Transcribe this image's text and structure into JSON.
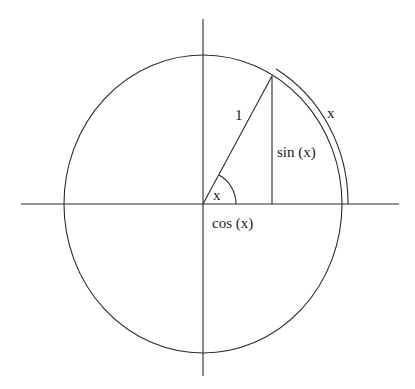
{
  "diagram": {
    "type": "unit-circle",
    "colors": {
      "stroke": "#2a2a2a",
      "text": "#1a1a1a",
      "background": "#ffffff"
    },
    "labels": {
      "radius": "1",
      "arc_length": "x",
      "angle": "x",
      "sine": "sin (x)",
      "cosine": "cos (x)"
    }
  }
}
